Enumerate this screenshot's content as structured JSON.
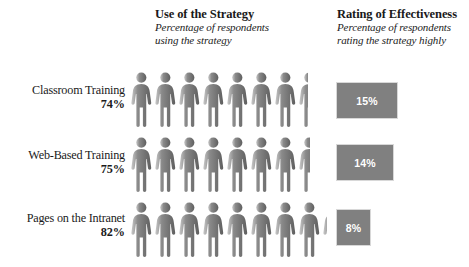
{
  "headers": {
    "use": {
      "title": "Use of the Strategy",
      "subtitle_line1": "Percentage of respondents",
      "subtitle_line2": "using the strategy"
    },
    "rating": {
      "title": "Rating of Effectiveness",
      "subtitle_line1": "Percentage of respondents",
      "subtitle_line2": "rating the strategy highly"
    }
  },
  "rows": [
    {
      "label": "Classroom Training",
      "use_percent_label": "74%",
      "rating_percent_label": "15%"
    },
    {
      "label": "Web-Based Training",
      "use_percent_label": "75%",
      "rating_percent_label": "14%"
    },
    {
      "label": "Pages on the Intranet",
      "use_percent_label": "82%",
      "rating_percent_label": "8%"
    }
  ],
  "icons": {
    "pictogram": "person-icon"
  },
  "colors": {
    "figure_gray": "#8a8a8a",
    "figure_shadow": "#5f5f5f",
    "box_fill": "#808080",
    "box_border": "#d8d8d8",
    "box_text": "#ffffff",
    "text": "#1a1a1a"
  },
  "chart_data": {
    "type": "bar",
    "subtitle": "Percentage of respondents using the strategy; Percentage of respondents rating the strategy highly",
    "categories": [
      "Classroom Training",
      "Web-Based Training",
      "Pages on the Intranet"
    ],
    "series": [
      {
        "name": "Use of the Strategy",
        "unit": "percent",
        "display": "pictogram",
        "icon_value": 10,
        "values": [
          74,
          75,
          82
        ]
      },
      {
        "name": "Rating of Effectiveness",
        "unit": "percent",
        "display": "filled-box",
        "values": [
          15,
          14,
          8
        ]
      }
    ],
    "xlabel": "",
    "ylabel": "",
    "ylim": [
      0,
      100
    ],
    "grid": false,
    "legend_position": "none"
  }
}
